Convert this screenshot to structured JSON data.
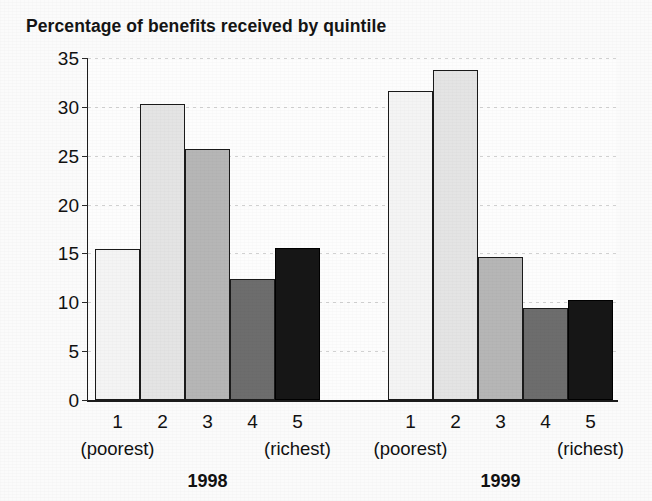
{
  "chart_data": {
    "type": "bar",
    "title": "Percentage of benefits received by quintile",
    "xlabel": "",
    "ylabel": "",
    "ylim": [
      0,
      35
    ],
    "ytick_step": 5,
    "yticks": [
      "35",
      "30",
      "25",
      "20",
      "15",
      "10",
      "5",
      "0"
    ],
    "grid": true,
    "legend": "none",
    "categories": [
      "1",
      "2",
      "3",
      "4",
      "5"
    ],
    "category_notes": {
      "first": "(poorest)",
      "last": "(richest)"
    },
    "groups": [
      {
        "name": "1998",
        "values": [
          15.5,
          30.3,
          25.7,
          12.4,
          15.6
        ]
      },
      {
        "name": "1999",
        "values": [
          31.6,
          33.8,
          14.6,
          9.4,
          10.2
        ]
      }
    ],
    "bar_colors": [
      "#f4f4f4",
      "#e4e4e4",
      "#b6b6b6",
      "#6d6d6d",
      "#161616"
    ],
    "axis_color": "#1a1a1a",
    "gridline_color": "#cfcfcf",
    "background": "#fbfbfb"
  }
}
